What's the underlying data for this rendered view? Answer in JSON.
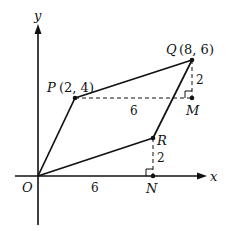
{
  "diagram": {
    "axes": {
      "x_label": "x",
      "y_label": "y",
      "origin_label": "O"
    },
    "points": {
      "P": {
        "name": "P",
        "coords": "(2, 4)"
      },
      "Q": {
        "name": "Q",
        "coords": "(8, 6)"
      },
      "R": {
        "name": "R"
      },
      "M": {
        "name": "M"
      },
      "N": {
        "name": "N"
      }
    },
    "measurements": {
      "PM": "6",
      "QM": "2",
      "ON": "6",
      "RN": "2"
    },
    "colors": {
      "line": "#111111",
      "background": "#ffffff"
    }
  }
}
